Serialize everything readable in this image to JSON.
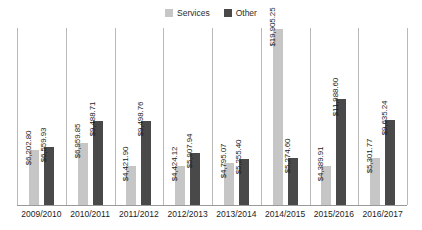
{
  "legend": {
    "position": "top-center",
    "items": [
      {
        "label": "Services",
        "color": "#c6c6c6"
      },
      {
        "label": "Other",
        "color": "#494949"
      }
    ]
  },
  "chart_data": {
    "type": "bar",
    "title": "",
    "subtitle": "",
    "xlabel": "",
    "ylabel": "",
    "grid": "vertical-separators",
    "ylim": [
      0,
      20000
    ],
    "categories": [
      "2009/2010",
      "2010/2011",
      "2011/2012",
      "2012/2013",
      "2013/2014",
      "2014/2015",
      "2015/2016",
      "2016/2017"
    ],
    "series": [
      {
        "name": "Services",
        "color": "#c6c6c6",
        "values": [
          6202.8,
          6959.85,
          4421.9,
          4424.12,
          4795.07,
          19905.25,
          4389.91,
          5301.77
        ],
        "labels": [
          "$6,202.80",
          "$6,959.85",
          "$4,421.90",
          "$4,424.12",
          "$4,795.07",
          "$19,905.25",
          "$4,389.91",
          "$5,301.77"
        ]
      },
      {
        "name": "Other",
        "color": "#494949",
        "values": [
          6559.93,
          9488.71,
          9498.76,
          5907.94,
          5255.4,
          5274.6,
          11988.6,
          9635.24
        ],
        "labels": [
          "$6,559.93",
          "$9,488.71",
          "$9,498.76",
          "$5,907.94",
          "$5,255.40",
          "$5,274.60",
          "$11,988.60",
          "$9,635.24"
        ]
      }
    ]
  }
}
